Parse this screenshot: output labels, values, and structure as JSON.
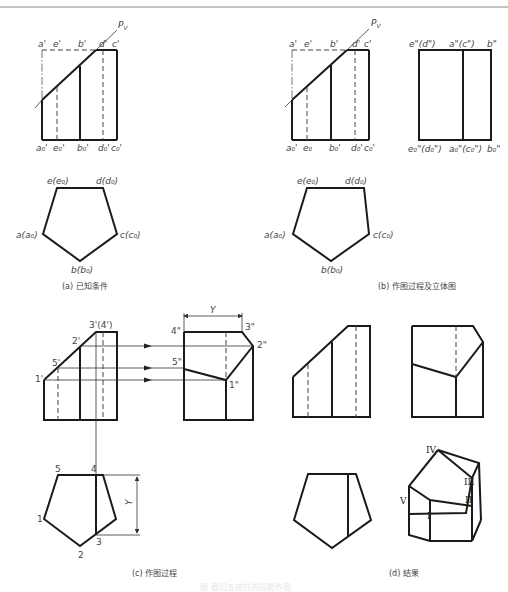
{
  "figure": {
    "caption_faint": "图  截切五棱柱的投影作图"
  },
  "panel_a": {
    "caption": "(a) 已知条件",
    "plane_label": "P",
    "plane_sub": "V",
    "front_top_labels": [
      "a'",
      "e'",
      "b'",
      "d'",
      "c'"
    ],
    "front_bottom_labels": [
      "a₀'",
      "e₀'",
      "b₀'",
      "d₀'",
      "c₀'"
    ],
    "top_view_labels": {
      "e": "e(e₀)",
      "d": "d(d₀)",
      "c": "c(c₀)",
      "b": "b(b₀)",
      "a": "a(a₀)"
    }
  },
  "panel_b": {
    "caption": "(b) 作图过程及立体图",
    "plane_label": "P",
    "plane_sub": "V",
    "front_top_labels": [
      "a'",
      "e'",
      "b'",
      "d'",
      "c'"
    ],
    "front_bottom_labels": [
      "a₀'",
      "e₀",
      "b₀'",
      "d₀'",
      "c₀'"
    ],
    "side_top_labels": [
      "e\"(d\")",
      "a\"(c\")",
      "b\""
    ],
    "side_bottom_labels": [
      "e₀\"(d₀\")",
      "a₀\"(c₀\")",
      "b₀\""
    ],
    "top_view_labels": {
      "e": "e(e₀)",
      "d": "d(d₀)",
      "c": "c(c₀)",
      "b": "b(b₀)",
      "a": "a(a₀)"
    }
  },
  "panel_c": {
    "caption": "(c)  作图过程",
    "front_labels": {
      "p34": "3'(4')",
      "p2": "2'",
      "p5": "5'",
      "p1": "1'"
    },
    "side_labels": {
      "p4": "4\"",
      "p3": "3\"",
      "p2": "2\"",
      "p5": "5\"",
      "p1": "1\""
    },
    "dimension_label": "Y",
    "top_view_labels": [
      "5",
      "4",
      "1",
      "2",
      "3"
    ],
    "top_dimension_label": "Y"
  },
  "panel_d": {
    "caption": "(d)  结果",
    "iso_labels": [
      "IV",
      "III",
      "II",
      "I",
      "V"
    ]
  }
}
